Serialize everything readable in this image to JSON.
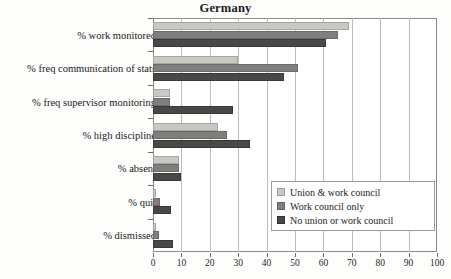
{
  "chart_data": {
    "type": "bar",
    "orientation": "horizontal",
    "title": "Germany",
    "xlabel": "",
    "ylabel": "",
    "xlim": [
      0,
      100
    ],
    "xticks": [
      0,
      10,
      20,
      30,
      40,
      50,
      60,
      70,
      80,
      90,
      100
    ],
    "grid": "vertical",
    "legend_position": "lower-right",
    "categories": [
      "% work monitored",
      "% freq communication of stats",
      "% freq supervisor monitoring",
      "% high discipline",
      "% absent",
      "% quit",
      "% dismissed"
    ],
    "series": [
      {
        "name": "Union & work council",
        "color": "#c9c9c4",
        "values": [
          69,
          30,
          6,
          23,
          9,
          1,
          1
        ]
      },
      {
        "name": "Work council only",
        "color": "#807f7d",
        "values": [
          65,
          51,
          6,
          26,
          9,
          2.5,
          2
        ]
      },
      {
        "name": "No union or work council",
        "color": "#494846",
        "values": [
          61,
          46,
          28,
          34,
          10,
          6.5,
          7
        ]
      }
    ]
  },
  "legend": {
    "items": [
      {
        "label": "Union & work council"
      },
      {
        "label": "Work council only"
      },
      {
        "label": "No union or work council"
      }
    ]
  }
}
